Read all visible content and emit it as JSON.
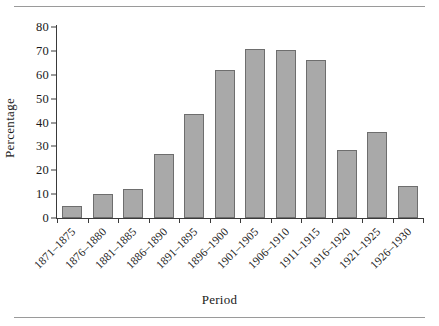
{
  "chart_data": {
    "type": "bar",
    "title": "",
    "xlabel": "Period",
    "ylabel": "Percentage",
    "categories": [
      "1871–1875",
      "1876–1880",
      "1881–1885",
      "1886–1890",
      "1891–1895",
      "1896–1900",
      "1901–1905",
      "1906–1910",
      "1911–1915",
      "1916–1920",
      "1921–1925",
      "1926–1930"
    ],
    "values": [
      5,
      10,
      12,
      27,
      43.5,
      62,
      71,
      70.5,
      66,
      28.5,
      36,
      13.5
    ],
    "ylim": [
      0,
      80
    ],
    "yticks": [
      0,
      10,
      20,
      30,
      40,
      50,
      60,
      70,
      80
    ],
    "ytick_labels": [
      "0",
      "10",
      "20",
      "30",
      "40",
      "50",
      "60",
      "70",
      "80"
    ],
    "grid": false,
    "legend": false,
    "bar_color": "#a9a9a9",
    "bar_edge_color": "#6e6e6e",
    "axis_color": "#3a3a3a",
    "rule_color": "#9a9a9a"
  }
}
